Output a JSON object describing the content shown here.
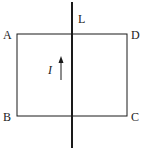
{
  "diagram": {
    "type": "physics-circuit",
    "wire": {
      "label": "L",
      "x": 72,
      "y_top": 2,
      "y_bottom": 148
    },
    "loop": {
      "vertices": [
        {
          "label": "A",
          "x": 17,
          "y": 34
        },
        {
          "label": "D",
          "x": 127,
          "y": 34
        },
        {
          "label": "C",
          "x": 127,
          "y": 116
        },
        {
          "label": "B",
          "x": 17,
          "y": 116
        }
      ]
    },
    "current": {
      "label": "I",
      "direction": "up"
    },
    "labels": {
      "A": "A",
      "B": "B",
      "C": "C",
      "D": "D",
      "L": "L",
      "I": "I"
    },
    "colors": {
      "stroke": "#1a1a1a",
      "background": "#ffffff"
    }
  }
}
